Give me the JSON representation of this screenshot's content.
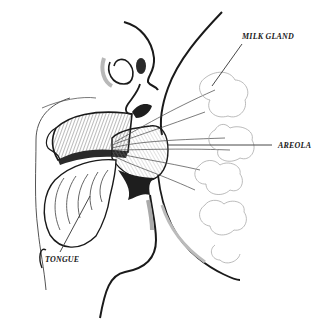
{
  "diagram": {
    "type": "anatomical-illustration",
    "labels": {
      "milk_gland": "MILK GLAND",
      "areola": "AREOLA",
      "tongue": "TONGUE"
    },
    "colors": {
      "ink": "#1a1a1a",
      "shading": "#7a7a7a",
      "light_shading": "#bdbdbd",
      "background": "#ffffff"
    }
  }
}
